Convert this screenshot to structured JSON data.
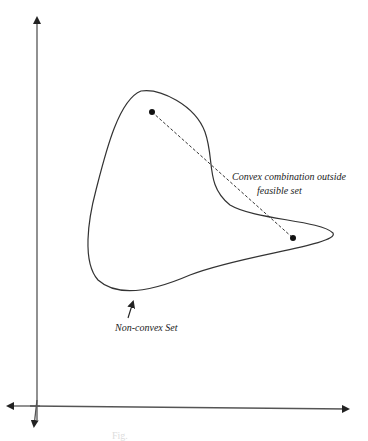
{
  "diagram": {
    "type": "non-convex set illustration",
    "labels": {
      "annotation_line1": "Convex combination outside",
      "annotation_line2": "feasible set",
      "set_label": "Non-convex Set",
      "caption": "Fig."
    },
    "points": [
      {
        "name": "point-a",
        "x": 152,
        "y": 112
      },
      {
        "name": "point-b",
        "x": 293,
        "y": 238
      }
    ],
    "colors": {
      "stroke": "#333333",
      "background": "#ffffff"
    }
  }
}
